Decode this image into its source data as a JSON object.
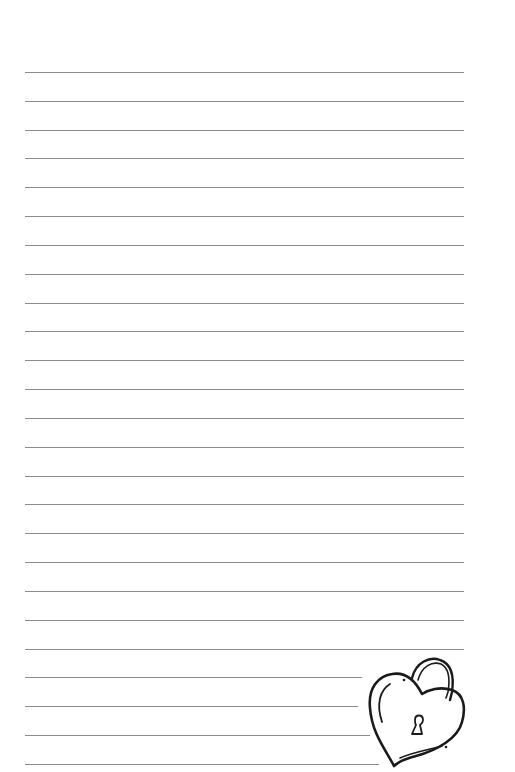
{
  "page": {
    "type": "lined-notepaper",
    "background_color": "#ffffff",
    "rule_color": "#8c8c8c"
  },
  "rules": {
    "count": 25,
    "first_y": 72,
    "spacing": 28.83,
    "left_x": 25,
    "full_right_x": 464,
    "short_rule_right_x": [
      362,
      358,
      370,
      379
    ]
  },
  "decoration": {
    "icon": "heart-padlock-icon",
    "stroke_color": "#1a1a1a"
  }
}
